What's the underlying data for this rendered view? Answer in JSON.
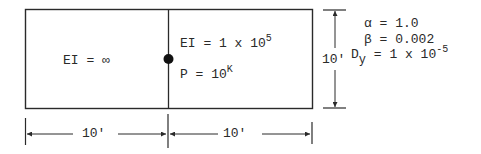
{
  "frame": {
    "left_member": {
      "label": "EI = ∞"
    },
    "right_member": {
      "ei_label": "EI = 1 x 10",
      "ei_exponent": "5",
      "load_label": "P = 10",
      "load_unit": "K"
    }
  },
  "dimensions": {
    "height": "10'",
    "left_span": "10'",
    "right_span": "10'"
  },
  "parameters": {
    "alpha": "α = 1.0",
    "beta": "β = 0.002",
    "dy_symbol": "D",
    "dy_subscript": "y",
    "dy_value": " = 1 x 10",
    "dy_exponent": "-5"
  },
  "colors": {
    "line": "#2a2a2a",
    "background": "#ffffff"
  }
}
